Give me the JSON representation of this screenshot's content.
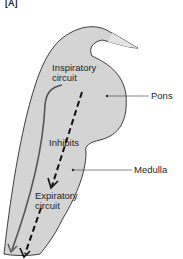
{
  "figure": {
    "panel_label": "[A]",
    "colors": {
      "tissue_fill": "#d4d4d4",
      "outline": "#2a2a2a",
      "arrow": "#111111",
      "pathway": "#555555",
      "leader_line": "#555555",
      "text": "#1e1e1e"
    }
  },
  "labels": {
    "inspiratory_line1": "Inspiratory",
    "inspiratory_line2": "circuit",
    "inhibits": "Inhibits",
    "expiratory_line1": "Expiratory",
    "expiratory_line2": "circuit",
    "pons": "Pons",
    "medulla": "Medulla"
  }
}
